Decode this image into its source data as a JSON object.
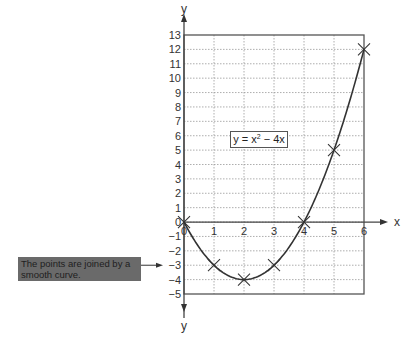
{
  "chart_data": {
    "type": "line",
    "title": "",
    "equation_label": "y = x² − 4x",
    "xlabel": "x",
    "ylabel": "y",
    "x": [
      0,
      1,
      2,
      3,
      4,
      5,
      6
    ],
    "series": [
      {
        "name": "y = x^2 - 4x",
        "values": [
          0,
          -3,
          -4,
          -3,
          0,
          5,
          12
        ],
        "marker": "x",
        "smooth": true
      }
    ],
    "xlim": [
      0,
      6
    ],
    "ylim": [
      -5,
      13
    ],
    "x_ticks": [
      "0",
      "1",
      "2",
      "3",
      "4",
      "5",
      "6"
    ],
    "y_ticks": [
      "13",
      "12",
      "11",
      "10",
      "9",
      "8",
      "7",
      "6",
      "5",
      "4",
      "3",
      "2",
      "1",
      "0",
      "−1",
      "−2",
      "−3",
      "−4",
      "−5"
    ],
    "grid": true,
    "annotation": "The points are joined by a smooth curve."
  },
  "labels": {
    "eq_prefix": "y = x",
    "eq_sup": "2",
    "eq_suffix": " − 4x",
    "callout": "The points are joined by a smooth curve.",
    "x_axis": "x",
    "y_axis_top": "y",
    "y_axis_bottom": "y"
  }
}
